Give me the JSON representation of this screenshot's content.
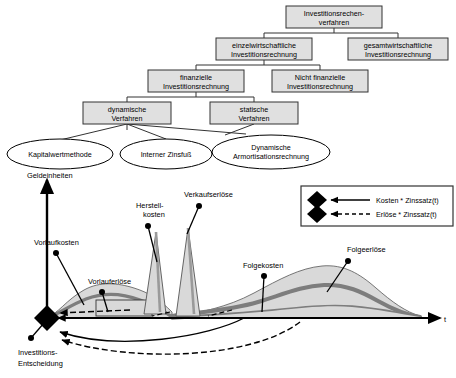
{
  "diagram": {
    "title_hierarchy": "Investitionsrechenverfahren",
    "tree": {
      "nodes": [
        {
          "id": "root",
          "lines": [
            "Investitionsrechen-",
            "verfahren"
          ],
          "x": 286,
          "y": 6,
          "w": 96,
          "h": 22
        },
        {
          "id": "einzel",
          "lines": [
            "einzelwirtschaftliche",
            "Investitionsrechnung"
          ],
          "x": 216,
          "y": 38,
          "w": 96,
          "h": 22
        },
        {
          "id": "gesamt",
          "lines": [
            "gesamtwirtschaftliche",
            "Investitionsrechnung"
          ],
          "x": 348,
          "y": 38,
          "w": 100,
          "h": 22
        },
        {
          "id": "finanz",
          "lines": [
            "finanzielle",
            "Investitionsrechnung"
          ],
          "x": 148,
          "y": 70,
          "w": 96,
          "h": 22
        },
        {
          "id": "nichtfin",
          "lines": [
            "Nicht finanzielle",
            "Investitionsrechnung"
          ],
          "x": 272,
          "y": 70,
          "w": 96,
          "h": 22
        },
        {
          "id": "dyn",
          "lines": [
            "dynamische",
            "Verfahren"
          ],
          "x": 83,
          "y": 102,
          "w": 88,
          "h": 22
        },
        {
          "id": "stat",
          "lines": [
            "statische",
            "Verfahren"
          ],
          "x": 210,
          "y": 102,
          "w": 88,
          "h": 22
        }
      ],
      "ellipses": [
        {
          "id": "kwm",
          "lines": [
            "Kapitalwertmethode"
          ],
          "cx": 60,
          "cy": 154,
          "rx": 53,
          "ry": 15
        },
        {
          "id": "izf",
          "lines": [
            "Interner Zinsfuß"
          ],
          "cx": 166,
          "cy": 154,
          "rx": 46,
          "ry": 15
        },
        {
          "id": "dar",
          "lines": [
            "Dynamische",
            "Armortisationsrechnung"
          ],
          "cx": 271,
          "cy": 152,
          "rx": 59,
          "ry": 17
        }
      ]
    },
    "chart": {
      "y_axis_label": "Geldeinheiten",
      "x_axis_label": "t",
      "origin_label": [
        "Investitions-",
        "Entscheidung"
      ],
      "callouts": [
        {
          "id": "vorlaufkosten",
          "text": "Vorlaufkosten",
          "x": 34,
          "y": 238
        },
        {
          "id": "vorlauferloese",
          "text": "Vorlauferlöse",
          "x": 88,
          "y": 281
        },
        {
          "id": "herstellkosten",
          "text": "Herstell-",
          "x": 136,
          "y": 205
        },
        {
          "id": "herstellkosten2",
          "text": "kosten",
          "x": 143,
          "y": 214
        },
        {
          "id": "verkaufserloese",
          "text": "Verkaufserlöse",
          "x": 184,
          "y": 194
        },
        {
          "id": "folgekosten",
          "text": "Folgekosten",
          "x": 243,
          "y": 265
        },
        {
          "id": "folgeerloese",
          "text": "Folgeerlöse",
          "x": 347,
          "y": 249
        }
      ]
    },
    "legend": {
      "items": [
        {
          "id": "kosten",
          "label": "Kosten * Zinssatz(t)",
          "line": "solid",
          "marker": "diamond"
        },
        {
          "id": "erloese",
          "label": "Erlöse * Zinssatz(t)",
          "line": "dashed",
          "marker": "diamond"
        }
      ]
    },
    "colors": {
      "box_fill": "#e0e0e0",
      "box_stroke": "#333333",
      "curve_fill_light": "#d9d9d9",
      "curve_band_dark": "#7d7d7d",
      "axis": "#000000",
      "ellipse_fill": "#ffffff"
    }
  }
}
